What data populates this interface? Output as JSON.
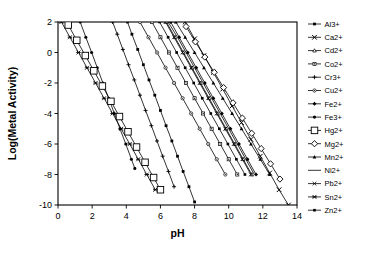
{
  "chart_data": {
    "type": "line",
    "title": "",
    "xlabel": "pH",
    "ylabel": "Log(Metal Activity)",
    "xlim": [
      0,
      14
    ],
    "ylim": [
      -10,
      2
    ],
    "xticks": [
      0,
      2,
      4,
      6,
      8,
      10,
      12,
      14
    ],
    "yticks": [
      2,
      0,
      -2,
      -4,
      -6,
      -8,
      -10
    ],
    "grid": false,
    "legend_position": "right",
    "line_color": "#000000",
    "series": [
      {
        "name": "Al3+",
        "marker": "filled-square",
        "slope": -3,
        "x": [
          4.07,
          4.33,
          4.67,
          5.0,
          5.33,
          5.67,
          6.0,
          6.33,
          6.67,
          7.0,
          7.33,
          7.67,
          8.0
        ],
        "y": [
          2,
          1.2,
          0.2,
          -0.8,
          -1.8,
          -2.8,
          -3.8,
          -4.8,
          -5.8,
          -6.8,
          -7.8,
          -8.8,
          -9.8
        ]
      },
      {
        "name": "Ca2+",
        "marker": "x-cross",
        "slope": -2,
        "x": [
          7.45,
          8.0,
          8.55,
          9.1,
          9.65,
          10.2,
          10.75,
          11.3,
          11.85,
          12.4,
          12.95,
          13.5,
          14.0
        ],
        "y": [
          2,
          0.9,
          -0.2,
          -1.3,
          -2.4,
          -3.5,
          -4.6,
          -5.7,
          -6.8,
          -7.9,
          -9.0,
          -10.0,
          -11.0
        ]
      },
      {
        "name": "Cd2+",
        "marker": "open-triangle",
        "slope": -2,
        "x": [
          6.35,
          6.85,
          7.35,
          7.85,
          8.35,
          8.85,
          9.35,
          9.85,
          10.35,
          10.85,
          11.35
        ],
        "y": [
          2,
          1.0,
          0.0,
          -1.0,
          -2.0,
          -3.0,
          -4.0,
          -5.0,
          -6.0,
          -7.0,
          -8.0
        ]
      },
      {
        "name": "Co2+",
        "marker": "open-square-small",
        "slope": -2,
        "x": [
          5.5,
          6.0,
          6.5,
          7.0,
          7.5,
          8.0,
          8.5,
          9.0,
          9.5,
          10.0,
          10.5
        ],
        "y": [
          2,
          1.0,
          0.0,
          -1.0,
          -2.0,
          -3.0,
          -4.0,
          -5.0,
          -6.0,
          -7.0,
          -8.0
        ]
      },
      {
        "name": "Cr3+",
        "marker": "plus",
        "slope": -3,
        "x": [
          3.2,
          3.47,
          3.8,
          4.13,
          4.47,
          4.8,
          5.13,
          5.47,
          5.8,
          6.13,
          6.47,
          6.8
        ],
        "y": [
          2,
          1.2,
          0.2,
          -0.8,
          -1.8,
          -2.8,
          -3.8,
          -4.8,
          -5.8,
          -6.8,
          -7.8,
          -8.8
        ]
      },
      {
        "name": "Cu2+",
        "marker": "open-circle-dotted",
        "slope": -2,
        "x": [
          4.8,
          5.3,
          5.8,
          6.3,
          6.8,
          7.3,
          7.8,
          8.3,
          8.8,
          9.3,
          9.8
        ],
        "y": [
          2,
          1.0,
          0.0,
          -1.0,
          -2.0,
          -3.0,
          -4.0,
          -5.0,
          -6.0,
          -7.0,
          -8.0
        ]
      },
      {
        "name": "Fe2+",
        "marker": "filled-diamond",
        "slope": -2,
        "x": [
          6.6,
          7.1,
          7.6,
          8.1,
          8.6,
          9.1,
          9.6,
          10.1,
          10.6,
          11.1,
          11.6
        ],
        "y": [
          2,
          1.0,
          0.0,
          -1.0,
          -2.0,
          -3.0,
          -4.0,
          -5.0,
          -6.0,
          -7.0,
          -8.0
        ]
      },
      {
        "name": "Fe3+",
        "marker": "filled-circle",
        "slope": -3,
        "x": [
          1.3,
          1.63,
          1.97,
          2.3,
          2.63,
          2.97,
          3.3,
          3.63,
          3.97,
          4.3,
          4.5
        ],
        "y": [
          2,
          1.0,
          0.0,
          -1.0,
          -2.0,
          -3.0,
          -4.0,
          -5.0,
          -6.0,
          -7.0,
          -7.6
        ]
      },
      {
        "name": "Hg2+",
        "marker": "open-square-large",
        "slope": -2,
        "x": [
          0.6,
          1.1,
          1.6,
          2.1,
          2.6,
          3.1,
          3.6,
          4.1,
          4.6,
          5.1,
          5.6,
          6.0
        ],
        "y": [
          1.8,
          0.8,
          -0.2,
          -1.2,
          -2.2,
          -3.2,
          -4.2,
          -5.2,
          -6.2,
          -7.2,
          -8.2,
          -9.0
        ]
      },
      {
        "name": "Mg2+",
        "marker": "open-diamond",
        "slope": -2,
        "x": [
          7.5,
          8.05,
          8.6,
          9.15,
          9.7,
          10.25,
          10.8,
          11.35,
          11.9,
          12.45,
          13.0
        ],
        "y": [
          1.7,
          0.7,
          -0.3,
          -1.3,
          -2.3,
          -3.3,
          -4.3,
          -5.3,
          -6.3,
          -7.3,
          -8.3
        ]
      },
      {
        "name": "Mn2+",
        "marker": "filled-triangle",
        "slope": -2,
        "x": [
          6.9,
          7.45,
          8.0,
          8.55,
          9.1,
          9.65,
          10.2,
          10.75,
          11.3,
          11.85,
          12.4
        ],
        "y": [
          2,
          1.0,
          0.0,
          -1.0,
          -2.0,
          -3.0,
          -4.0,
          -5.0,
          -6.0,
          -7.0,
          -8.0
        ]
      },
      {
        "name": "Ni2+",
        "marker": "none",
        "slope": -2,
        "x": [
          6.45,
          7.0,
          7.5,
          8.0,
          8.5,
          9.0,
          9.5,
          10.0,
          10.5,
          11.0,
          11.5
        ],
        "y": [
          2,
          1.0,
          0.0,
          -1.0,
          -2.0,
          -3.0,
          -4.0,
          -5.0,
          -6.0,
          -7.0,
          -8.0
        ]
      },
      {
        "name": "Pb2+",
        "marker": "x-thin",
        "slope": -2,
        "x": [
          6.3,
          6.8,
          7.3,
          7.8,
          8.3,
          8.8,
          9.3,
          9.8,
          10.3,
          10.8,
          11.3
        ],
        "y": [
          2,
          1.0,
          0.0,
          -1.0,
          -2.0,
          -3.0,
          -4.0,
          -5.0,
          -6.0,
          -7.0,
          -8.0
        ]
      },
      {
        "name": "Sn2+",
        "marker": "star-x",
        "slope": -2,
        "x": [
          0.2,
          0.7,
          1.2,
          1.7,
          2.2,
          2.7,
          3.2,
          3.7,
          4.2,
          4.7,
          5.2,
          5.7
        ],
        "y": [
          2,
          1.0,
          0.0,
          -1.0,
          -2.0,
          -3.0,
          -4.0,
          -5.0,
          -6.0,
          -7.0,
          -8.0,
          -9.0
        ]
      },
      {
        "name": "Zn2+",
        "marker": "filled-square-sm",
        "slope": -2,
        "x": [
          5.95,
          6.45,
          6.95,
          7.45,
          7.95,
          8.45,
          8.95,
          9.45,
          9.95,
          10.45,
          10.95
        ],
        "y": [
          2,
          1.0,
          0.0,
          -1.0,
          -2.0,
          -3.0,
          -4.0,
          -5.0,
          -6.0,
          -7.0,
          -8.0
        ]
      }
    ],
    "legend_entries": [
      "Al3+",
      "Ca2+",
      "Cd2+",
      "Co2+",
      "Cr3+",
      "Cu2+",
      "Fe2+",
      "Fe3+",
      "Hg2+",
      "Mg2+",
      "Mn2+",
      "Ni2+",
      "Pb2+",
      "Sn2+",
      "Zn2+"
    ]
  }
}
